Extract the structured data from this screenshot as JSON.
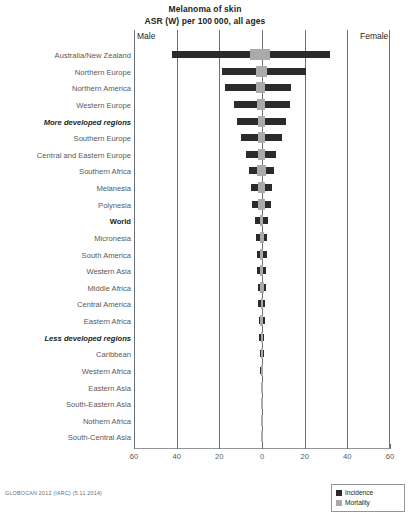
{
  "title": {
    "line1": "Melanoma of skin",
    "line2": "ASR (W) per 100 000, all ages"
  },
  "sides": {
    "left_label": "Male",
    "right_label": "Female"
  },
  "footer": {
    "source": "GLOBOCAN 2012 (IARC) (5.11.2014)"
  },
  "legend": {
    "position": "bottom-right",
    "items": [
      {
        "label": "Incidence",
        "color": "#2b2b2b",
        "key": "incidence"
      },
      {
        "label": "Mortality",
        "color": "#a9aaac",
        "key": "mortality"
      }
    ]
  },
  "axis": {
    "ticks": [
      60,
      40,
      20,
      0,
      20,
      40,
      60
    ],
    "tick_labels": [
      "60",
      "40",
      "20",
      "0",
      "20",
      "40",
      "60"
    ],
    "max": 60,
    "unit": "ASR (W) per 100 000"
  },
  "chart_data": {
    "type": "bar",
    "orientation": "horizontal",
    "layout": "back-to-back population pyramid",
    "title": "Melanoma of skin",
    "subtitle": "ASR (W) per 100 000, all ages",
    "xlabel": "",
    "ylabel": "",
    "xlim": [
      -60,
      60
    ],
    "grid": true,
    "legend_entries": [
      "Incidence",
      "Mortality"
    ],
    "left_side": "Male",
    "right_side": "Female",
    "categories": [
      "Australia/New Zealand",
      "Northern Europe",
      "Northern America",
      "Western Europe",
      "More developed regions",
      "Southern Europe",
      "Central and Eastern Europe",
      "Southern Africa",
      "Melanesia",
      "Polynesia",
      "World",
      "Micronesia",
      "South America",
      "Western Asia",
      "Middle Africa",
      "Central America",
      "Eastern Africa",
      "Less developed regions",
      "Caribbean",
      "Western Africa",
      "Eastern Asia",
      "South-Eastern Asia",
      "Nothern Africa",
      "South-Central Asia"
    ],
    "emphasis": {
      "More developed regions": "bold-italic",
      "Less developed regions": "bold-italic",
      "World": "bold"
    },
    "series": [
      {
        "name": "Male incidence",
        "side": "left",
        "metric": "incidence",
        "color": "#2b2b2b",
        "values": [
          42.0,
          18.6,
          17.2,
          12.9,
          11.6,
          10.0,
          7.4,
          6.1,
          5.0,
          4.7,
          3.3,
          2.7,
          2.5,
          2.3,
          1.9,
          1.7,
          1.5,
          1.2,
          1.0,
          0.8,
          0.7,
          0.6,
          0.5,
          0.4
        ]
      },
      {
        "name": "Male mortality",
        "side": "left",
        "metric": "mortality",
        "color": "#a9aaac",
        "values": [
          5.6,
          3.0,
          2.6,
          2.2,
          2.1,
          1.9,
          1.7,
          2.4,
          1.8,
          1.7,
          0.8,
          1.0,
          0.9,
          0.8,
          0.9,
          0.7,
          0.8,
          0.6,
          0.6,
          0.5,
          0.3,
          0.4,
          0.3,
          0.2
        ]
      },
      {
        "name": "Female incidence",
        "side": "right",
        "metric": "incidence",
        "color": "#2b2b2b",
        "values": [
          32.0,
          20.4,
          13.5,
          13.0,
          11.2,
          9.3,
          6.5,
          5.6,
          4.6,
          4.3,
          2.8,
          2.5,
          2.3,
          2.0,
          1.8,
          1.6,
          1.4,
          1.1,
          0.9,
          0.7,
          0.6,
          0.5,
          0.4,
          0.3
        ]
      },
      {
        "name": "Female mortality",
        "side": "right",
        "metric": "mortality",
        "color": "#a9aaac",
        "values": [
          3.6,
          2.2,
          1.6,
          1.5,
          1.4,
          1.3,
          1.2,
          2.1,
          1.6,
          1.5,
          0.6,
          0.8,
          0.7,
          0.6,
          0.8,
          0.6,
          0.7,
          0.5,
          0.5,
          0.4,
          0.2,
          0.3,
          0.2,
          0.2
        ]
      }
    ]
  }
}
